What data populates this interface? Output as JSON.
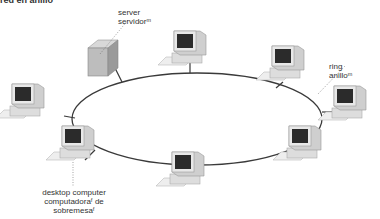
{
  "header": {
    "title": "red en anillo"
  },
  "labels": {
    "server": {
      "en": "server",
      "es": "servidorᵐ"
    },
    "ring": {
      "en": "ring",
      "es": "anilloᵐ"
    },
    "desktop": {
      "en": "desktop computer",
      "es_line1": "computadoraᶠ de",
      "es_line2": "sobremesaᶠ"
    }
  },
  "nodes": [
    {
      "id": "server",
      "type": "server",
      "x": 96,
      "y": 38
    },
    {
      "id": "pc-top",
      "type": "desktop",
      "x": 173,
      "y": 30
    },
    {
      "id": "pc-top-right",
      "type": "desktop",
      "x": 272,
      "y": 45
    },
    {
      "id": "pc-right",
      "type": "desktop",
      "x": 330,
      "y": 85
    },
    {
      "id": "pc-bottom-right",
      "type": "desktop",
      "x": 285,
      "y": 125
    },
    {
      "id": "pc-bottom",
      "type": "desktop",
      "x": 173,
      "y": 150
    },
    {
      "id": "pc-bottom-left",
      "type": "desktop",
      "x": 62,
      "y": 125
    },
    {
      "id": "pc-left",
      "type": "desktop",
      "x": 12,
      "y": 83
    }
  ],
  "colors": {
    "ring": "#3a3a3a",
    "leader": "#666666",
    "monitor": "#e6e6e6",
    "screen": "#2b2b2b"
  }
}
